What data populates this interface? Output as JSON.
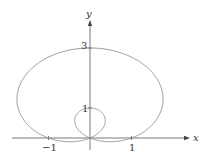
{
  "figure": {
    "equation": "r = 1 + 2 sin θ",
    "curve_type": "limaçon with inner loop",
    "axis_labels": {
      "x": "x",
      "y": "y"
    },
    "tick_labels": {
      "x_neg": "−1",
      "x_pos": "1",
      "y_inner": "1",
      "y_outer": "3"
    },
    "colors": {
      "curve": "#8a8a8a",
      "axis": "#555555"
    }
  }
}
